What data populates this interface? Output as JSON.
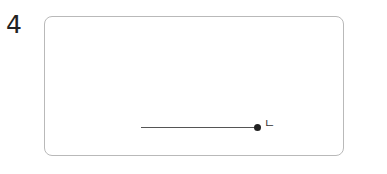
{
  "question": {
    "number": "4"
  },
  "figure": {
    "segment": {
      "endpoint_label": "ㄴ"
    }
  }
}
